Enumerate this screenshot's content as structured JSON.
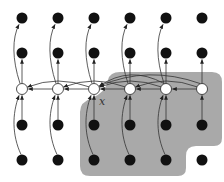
{
  "diagram": {
    "title": "",
    "region_color": "#a9a9a9",
    "node_fill_black": "#111111",
    "node_fill_white": "#ffffff",
    "edge_color": "#333333",
    "columns_x": [
      22,
      58,
      94,
      130,
      166,
      202
    ],
    "rows_y": [
      18,
      53,
      89,
      125,
      160
    ],
    "center_row_index": 2,
    "center_node": {
      "col": 2,
      "row": 2,
      "label": "x"
    },
    "region_label": "shaded-region",
    "node_types": {
      "top_rows": "black",
      "center_row": "white",
      "bottom_rows": "black"
    }
  }
}
